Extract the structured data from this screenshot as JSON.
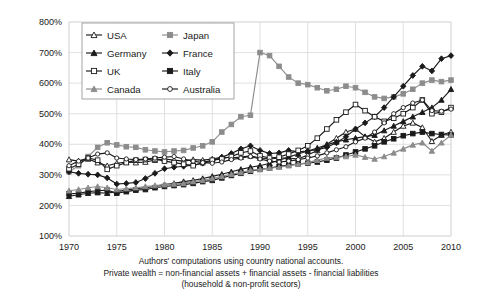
{
  "chart_data": {
    "type": "line",
    "title": "",
    "xlabel": "",
    "ylabel": "",
    "xlim": [
      1970,
      2010
    ],
    "ylim": [
      100,
      800
    ],
    "grid": true,
    "legend_position": "top-left-inside",
    "y_tick_labels": [
      "100%",
      "200%",
      "300%",
      "400%",
      "500%",
      "600%",
      "700%",
      "800%"
    ],
    "y_ticks": [
      100,
      200,
      300,
      400,
      500,
      600,
      700,
      800
    ],
    "x_tick_labels": [
      "1970",
      "1975",
      "1980",
      "1985",
      "1990",
      "1995",
      "2000",
      "2005",
      "2010"
    ],
    "x_ticks": [
      1970,
      1975,
      1980,
      1985,
      1990,
      1995,
      2000,
      2005,
      2010
    ],
    "x": [
      1970,
      1971,
      1972,
      1973,
      1974,
      1975,
      1976,
      1977,
      1978,
      1979,
      1980,
      1981,
      1982,
      1983,
      1984,
      1985,
      1986,
      1987,
      1988,
      1989,
      1990,
      1991,
      1992,
      1993,
      1994,
      1995,
      1996,
      1997,
      1998,
      1999,
      2000,
      2001,
      2002,
      2003,
      2004,
      2005,
      2006,
      2007,
      2008,
      2009,
      2010
    ],
    "series": [
      {
        "name": "USA",
        "color": "#1a1a1a",
        "marker": "triangle-open",
        "values": [
          350,
          345,
          352,
          340,
          330,
          338,
          342,
          340,
          342,
          348,
          352,
          348,
          345,
          350,
          348,
          352,
          358,
          356,
          358,
          362,
          355,
          352,
          355,
          355,
          352,
          365,
          380,
          400,
          420,
          440,
          450,
          425,
          408,
          420,
          440,
          460,
          470,
          455,
          410,
          430,
          440
        ]
      },
      {
        "name": "Japan",
        "color": "#8c8c8c",
        "marker": "square-filled",
        "values": [
          310,
          330,
          360,
          390,
          405,
          398,
          392,
          390,
          382,
          378,
          375,
          378,
          380,
          388,
          395,
          408,
          440,
          465,
          490,
          495,
          700,
          690,
          655,
          620,
          600,
          595,
          585,
          575,
          580,
          590,
          585,
          570,
          555,
          550,
          555,
          565,
          580,
          600,
          610,
          605,
          610
        ]
      },
      {
        "name": "Germany",
        "color": "#1a1a1a",
        "marker": "triangle-filled",
        "values": [
          230,
          235,
          240,
          242,
          240,
          245,
          250,
          255,
          258,
          262,
          268,
          272,
          278,
          282,
          288,
          295,
          302,
          310,
          318,
          325,
          330,
          338,
          348,
          358,
          368,
          378,
          388,
          398,
          408,
          415,
          420,
          425,
          430,
          445,
          460,
          475,
          490,
          505,
          520,
          545,
          580
        ]
      },
      {
        "name": "France",
        "color": "#1a1a1a",
        "marker": "diamond-filled",
        "values": [
          310,
          305,
          302,
          300,
          290,
          270,
          272,
          275,
          288,
          305,
          320,
          325,
          328,
          332,
          338,
          345,
          358,
          370,
          385,
          395,
          380,
          370,
          372,
          380,
          375,
          378,
          382,
          390,
          405,
          425,
          450,
          470,
          490,
          520,
          555,
          590,
          625,
          655,
          640,
          680,
          690
        ]
      },
      {
        "name": "UK",
        "color": "#1a1a1a",
        "marker": "square-open",
        "values": [
          320,
          335,
          355,
          348,
          318,
          330,
          340,
          348,
          350,
          352,
          345,
          340,
          335,
          330,
          340,
          348,
          352,
          360,
          372,
          378,
          362,
          355,
          358,
          368,
          380,
          395,
          420,
          450,
          480,
          505,
          530,
          510,
          490,
          475,
          485,
          500,
          520,
          545,
          500,
          505,
          520
        ]
      },
      {
        "name": "Italy",
        "color": "#1a1a1a",
        "marker": "square-filled",
        "values": [
          238,
          240,
          245,
          248,
          250,
          240,
          245,
          250,
          252,
          258,
          262,
          265,
          268,
          272,
          278,
          282,
          290,
          298,
          305,
          312,
          318,
          322,
          328,
          332,
          335,
          338,
          342,
          348,
          355,
          365,
          375,
          385,
          395,
          408,
          418,
          428,
          435,
          440,
          435,
          432,
          430
        ]
      },
      {
        "name": "Canada",
        "color": "#8c8c8c",
        "marker": "triangle-filled",
        "values": [
          248,
          252,
          258,
          262,
          258,
          252,
          255,
          258,
          262,
          265,
          268,
          270,
          272,
          278,
          282,
          288,
          295,
          302,
          308,
          315,
          318,
          322,
          325,
          330,
          335,
          340,
          348,
          355,
          358,
          360,
          365,
          358,
          352,
          360,
          372,
          385,
          398,
          405,
          378,
          405,
          430
        ]
      },
      {
        "name": "Australia",
        "color": "#1a1a1a",
        "marker": "circle-open",
        "values": [
          330,
          345,
          355,
          368,
          372,
          355,
          352,
          350,
          352,
          355,
          358,
          360,
          352,
          345,
          340,
          338,
          342,
          350,
          355,
          360,
          352,
          345,
          342,
          345,
          350,
          355,
          362,
          372,
          382,
          392,
          408,
          420,
          440,
          470,
          500,
          520,
          535,
          545,
          510,
          508,
          515
        ]
      }
    ]
  },
  "legend": {
    "entries": [
      {
        "label": "USA"
      },
      {
        "label": "Japan"
      },
      {
        "label": "Germany"
      },
      {
        "label": "France"
      },
      {
        "label": "UK"
      },
      {
        "label": "Italy"
      },
      {
        "label": "Canada"
      },
      {
        "label": "Australia"
      }
    ]
  },
  "caption": {
    "line1": "Authors' computations using country national accounts.",
    "line2": "Private wealth = non-financial assets + financial assets - financial liabilities",
    "line3": "(household & non-profit sectors)"
  }
}
